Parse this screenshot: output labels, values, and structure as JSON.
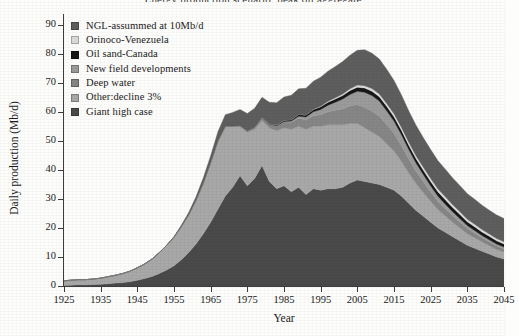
{
  "figure": {
    "cut_title": "Energy production scenario: peak oil aggregate",
    "background": "#fdfdfb",
    "ink": "#1a1a1a"
  },
  "axes": {
    "ylabel": "Daily production (Mb/d)",
    "xlabel": "Year",
    "yticks": [
      "0",
      "10",
      "20",
      "30",
      "40",
      "50",
      "60",
      "70",
      "80",
      "90"
    ],
    "xticks": [
      "1925",
      "1935",
      "1945",
      "1955",
      "1965",
      "1975",
      "1985",
      "1995",
      "2005",
      "2015",
      "2025",
      "2035",
      "2045"
    ]
  },
  "legend": {
    "items": [
      {
        "label": "NGL-assummed at 10Mb/d",
        "color": "#5e5e5e"
      },
      {
        "label": "Orinoco-Venezuela",
        "color": "#dcdcdc"
      },
      {
        "label": "Oil sand-Canada",
        "color": "#171717"
      },
      {
        "label": "New field developments",
        "color": "#9b9b9b"
      },
      {
        "label": "Deep water",
        "color": "#868686"
      },
      {
        "label": "Other:decline 3%",
        "color": "#a8a8a8"
      },
      {
        "label": "Giant high case",
        "color": "#4a4a4a"
      }
    ]
  },
  "chart_data": {
    "type": "area",
    "stacked": true,
    "title": "Energy production scenario: peak oil aggregate",
    "xlabel": "Year",
    "ylabel": "Daily production (Mb/d)",
    "xlim": [
      1925,
      2045
    ],
    "ylim": [
      0,
      93
    ],
    "grid": false,
    "legend_position": "top-left",
    "units": "Mb/d",
    "x": [
      1925,
      1927,
      1929,
      1931,
      1933,
      1935,
      1937,
      1939,
      1941,
      1943,
      1945,
      1947,
      1949,
      1951,
      1953,
      1955,
      1957,
      1959,
      1961,
      1963,
      1965,
      1967,
      1969,
      1971,
      1973,
      1975,
      1977,
      1979,
      1981,
      1983,
      1985,
      1987,
      1989,
      1991,
      1993,
      1995,
      1997,
      1999,
      2001,
      2003,
      2005,
      2007,
      2009,
      2011,
      2013,
      2015,
      2017,
      2019,
      2021,
      2023,
      2025,
      2027,
      2029,
      2031,
      2033,
      2035,
      2037,
      2039,
      2041,
      2043,
      2045
    ],
    "series": [
      {
        "name": "Giant high case",
        "color": "#4a4a4a",
        "values": [
          0.2,
          0.3,
          0.4,
          0.4,
          0.5,
          0.6,
          0.8,
          1.0,
          1.2,
          1.5,
          2.0,
          2.6,
          3.3,
          4.3,
          5.5,
          7.0,
          9.0,
          11.5,
          14.5,
          18.0,
          22.0,
          26.5,
          31.0,
          34.0,
          38.0,
          34.5,
          37.0,
          41.5,
          36.0,
          33.5,
          34.5,
          32.5,
          34.0,
          31.5,
          33.5,
          33.0,
          33.5,
          33.5,
          34.0,
          35.5,
          36.5,
          36.0,
          35.5,
          35.0,
          34.0,
          33.0,
          31.0,
          28.5,
          26.0,
          24.0,
          22.0,
          20.0,
          18.5,
          17.0,
          15.5,
          14.0,
          13.0,
          12.0,
          11.0,
          10.0,
          9.3
        ]
      },
      {
        "name": "Other:decline 3%",
        "color": "#a8a8a8",
        "values": [
          1.6,
          1.7,
          1.8,
          1.8,
          1.9,
          2.1,
          2.4,
          2.7,
          3.1,
          3.6,
          4.3,
          5.0,
          6.0,
          7.2,
          8.5,
          9.8,
          11.5,
          13.0,
          15.0,
          17.5,
          20.5,
          23.5,
          24.0,
          21.0,
          17.0,
          18.5,
          17.0,
          15.5,
          18.5,
          20.0,
          20.0,
          21.5,
          21.0,
          22.5,
          21.5,
          22.0,
          22.0,
          22.0,
          21.5,
          20.5,
          19.5,
          18.5,
          17.5,
          16.5,
          15.0,
          13.5,
          12.0,
          10.5,
          9.3,
          8.2,
          7.2,
          6.3,
          5.6,
          5.0,
          4.5,
          4.0,
          3.6,
          3.2,
          2.9,
          2.6,
          2.4
        ]
      },
      {
        "name": "Deep water",
        "color": "#868686",
        "values": [
          0,
          0,
          0,
          0,
          0,
          0,
          0,
          0,
          0,
          0,
          0,
          0,
          0,
          0,
          0,
          0,
          0,
          0,
          0,
          0,
          0,
          0,
          0,
          0,
          0.2,
          0.4,
          0.7,
          1.0,
          1.3,
          1.7,
          2.0,
          2.4,
          2.8,
          3.2,
          3.6,
          4.0,
          4.5,
          5.0,
          5.5,
          6.0,
          6.5,
          7.0,
          7.2,
          7.0,
          6.6,
          6.0,
          5.4,
          4.8,
          4.2,
          3.7,
          3.2,
          2.8,
          2.5,
          2.2,
          2.0,
          1.8,
          1.6,
          1.4,
          1.3,
          1.2,
          1.1
        ]
      },
      {
        "name": "New field developments",
        "color": "#9b9b9b",
        "values": [
          0,
          0,
          0,
          0,
          0,
          0,
          0,
          0,
          0,
          0,
          0,
          0,
          0,
          0,
          0,
          0,
          0,
          0,
          0,
          0,
          0,
          0,
          0,
          0,
          0,
          0,
          0,
          0,
          0,
          0,
          0.2,
          0.4,
          0.7,
          1.0,
          1.4,
          1.8,
          2.3,
          2.8,
          3.4,
          4.0,
          4.6,
          5.2,
          5.4,
          5.2,
          4.8,
          4.3,
          3.8,
          3.3,
          2.9,
          2.5,
          2.1,
          1.8,
          1.6,
          1.4,
          1.2,
          1.0,
          0.9,
          0.8,
          0.7,
          0.65,
          0.6
        ]
      },
      {
        "name": "Oil sand-Canada",
        "color": "#171717",
        "values": [
          0,
          0,
          0,
          0,
          0,
          0,
          0,
          0,
          0,
          0,
          0,
          0,
          0,
          0,
          0,
          0,
          0,
          0,
          0,
          0,
          0,
          0,
          0,
          0,
          0,
          0,
          0,
          0,
          0.2,
          0.3,
          0.4,
          0.5,
          0.6,
          0.7,
          0.8,
          0.9,
          1.0,
          1.1,
          1.2,
          1.3,
          1.4,
          1.5,
          1.5,
          1.5,
          1.5,
          1.5,
          1.5,
          1.5,
          1.5,
          1.5,
          1.5,
          1.5,
          1.5,
          1.4,
          1.4,
          1.3,
          1.3,
          1.2,
          1.2,
          1.1,
          1.1
        ]
      },
      {
        "name": "Orinoco-Venezuela",
        "color": "#dcdcdc",
        "values": [
          0,
          0,
          0,
          0,
          0,
          0,
          0,
          0,
          0,
          0,
          0,
          0,
          0,
          0,
          0,
          0,
          0,
          0,
          0,
          0,
          0,
          0,
          0,
          0,
          0,
          0,
          0,
          0,
          0,
          0,
          0,
          0,
          0,
          0,
          0.1,
          0.2,
          0.3,
          0.4,
          0.5,
          0.6,
          0.7,
          0.8,
          0.9,
          0.95,
          1.0,
          1.0,
          1.0,
          1.0,
          1.0,
          1.0,
          1.0,
          1.0,
          1.0,
          1.0,
          0.95,
          0.9,
          0.9,
          0.85,
          0.8,
          0.8,
          0.75
        ]
      },
      {
        "name": "NGL-assummed at 10Mb/d",
        "color": "#5e5e5e",
        "values": [
          0,
          0,
          0,
          0,
          0,
          0,
          0,
          0,
          0,
          0,
          0,
          0,
          0,
          0,
          0,
          0.2,
          0.4,
          0.8,
          1.2,
          1.8,
          2.4,
          3.2,
          4.0,
          4.8,
          5.6,
          6.0,
          6.5,
          7.0,
          7.3,
          7.6,
          8.0,
          8.4,
          8.8,
          9.2,
          9.6,
          10.0,
          10.4,
          10.8,
          11.2,
          11.6,
          12.0,
          12.4,
          12.2,
          12.0,
          11.8,
          11.5,
          11.2,
          10.8,
          10.5,
          10.2,
          10.0,
          9.7,
          9.5,
          9.2,
          9.0,
          8.8,
          8.6,
          8.4,
          8.2,
          8.1,
          8.0
        ]
      }
    ],
    "annotations": {
      "peak_year": 2007,
      "peak_total": 92
    }
  }
}
